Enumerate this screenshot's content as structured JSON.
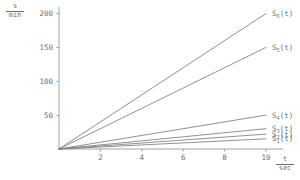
{
  "chart_data": {
    "type": "line",
    "title": "",
    "xlabel": "t / sec",
    "ylabel": "s / min",
    "x": [
      0,
      10
    ],
    "xlim": [
      0,
      10.7
    ],
    "ylim": [
      0,
      215
    ],
    "grid": false,
    "legend_position": "right-of-curve-ends",
    "xticks": [
      2,
      4,
      6,
      8,
      10
    ],
    "yticks": [
      50,
      100,
      150,
      200
    ],
    "series": [
      {
        "name": "S_1(t)",
        "label": "S",
        "subscript": "1",
        "suffix": "(t)",
        "slope": 15,
        "values": [
          0,
          15
        ]
      },
      {
        "name": "S_2(t)",
        "label": "S",
        "subscript": "2",
        "suffix": "(t)",
        "slope": 22,
        "values": [
          0,
          22
        ]
      },
      {
        "name": "S_3(t)",
        "label": "S",
        "subscript": "3",
        "suffix": "(t)",
        "slope": 30,
        "values": [
          0,
          30
        ]
      },
      {
        "name": "S_4(t)",
        "label": "S",
        "subscript": "4",
        "suffix": "(t)",
        "slope": 50,
        "values": [
          0,
          50
        ]
      },
      {
        "name": "S_5(t)",
        "label": "S",
        "subscript": "5",
        "suffix": "(t)",
        "slope": 150,
        "values": [
          0,
          150
        ]
      },
      {
        "name": "S_6(t)",
        "label": "S",
        "subscript": "6",
        "suffix": "(t)",
        "slope": 200,
        "values": [
          0,
          200
        ]
      }
    ]
  },
  "axes": {
    "y_axis_numerator": "s",
    "y_axis_denominator": "min",
    "x_axis_numerator": "t",
    "x_axis_denominator": "sec",
    "ytick_labels": [
      "50",
      "100",
      "150",
      "200"
    ],
    "xtick_labels": [
      "2",
      "4",
      "6",
      "8",
      "10"
    ]
  },
  "colors": {
    "background": "#ffffff",
    "axis": "#8a8a8a",
    "curve": "#7d7d7d",
    "text": "#6e6e6e"
  }
}
